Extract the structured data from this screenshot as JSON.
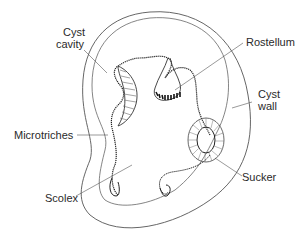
{
  "diagram": {
    "labels": {
      "cyst_cavity_1": "Cyst",
      "cyst_cavity_2": "cavity",
      "rostellum": "Rostellum",
      "cyst_wall_1": "Cyst",
      "cyst_wall_2": "wall",
      "microtriches": "Microtriches",
      "scolex": "Scolex",
      "sucker": "Sucker"
    },
    "colors": {
      "line": "#3a3a3a",
      "background": "#ffffff",
      "text": "#2a2a2a"
    }
  }
}
